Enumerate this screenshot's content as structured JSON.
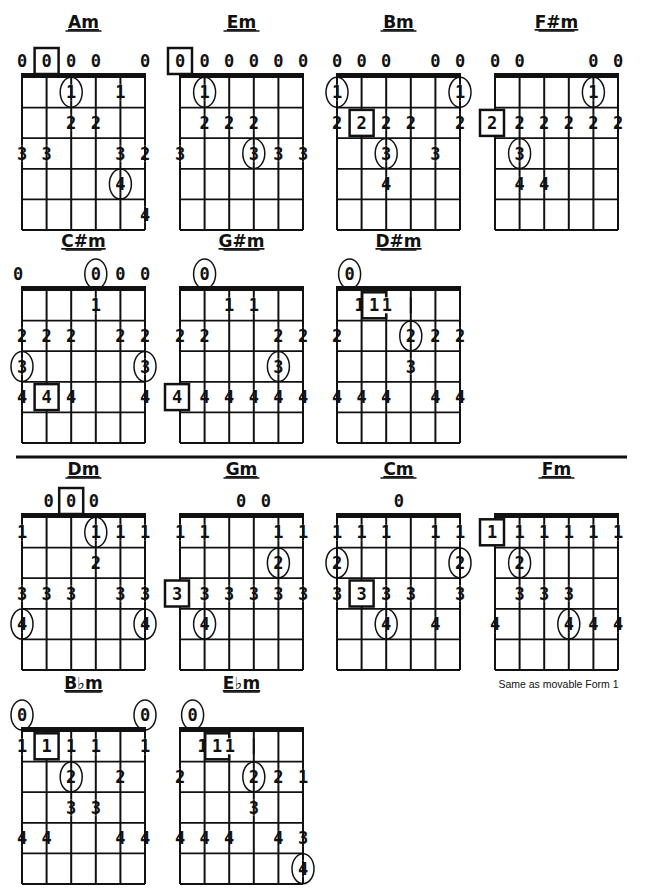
{
  "page": {
    "divider": {
      "y": 457,
      "x1": 16,
      "x2": 627
    },
    "layout": {
      "string_spacing": 24.6,
      "fret_spacing": 30.6,
      "frets": 5
    }
  },
  "chords": [
    {
      "name": "Am",
      "x": 22,
      "title_y": 28,
      "nut_y": 77,
      "marks": [
        {
          "s": 0,
          "f": 0,
          "t": "0"
        },
        {
          "s": 1,
          "f": 0,
          "t": "0",
          "style": "box"
        },
        {
          "s": 2,
          "f": 0,
          "t": "0"
        },
        {
          "s": 3,
          "f": 0,
          "t": "0"
        },
        {
          "s": 5,
          "f": 0,
          "t": "0"
        },
        {
          "s": 2,
          "f": 1,
          "t": "1",
          "style": "circle"
        },
        {
          "s": 4,
          "f": 1,
          "t": "1"
        },
        {
          "s": 2,
          "f": 2,
          "t": "2"
        },
        {
          "s": 3,
          "f": 2,
          "t": "2"
        },
        {
          "s": 0,
          "f": 3,
          "t": "3"
        },
        {
          "s": 1,
          "f": 3,
          "t": "3"
        },
        {
          "s": 4,
          "f": 3,
          "t": "3"
        },
        {
          "s": 5,
          "f": 3,
          "t": "2"
        },
        {
          "s": 4,
          "f": 4,
          "t": "4",
          "style": "circle"
        },
        {
          "s": 5,
          "f": 5,
          "t": "4"
        }
      ]
    },
    {
      "name": "Em",
      "x": 180,
      "title_y": 28,
      "nut_y": 77,
      "marks": [
        {
          "s": 0,
          "f": 0,
          "t": "0",
          "style": "box"
        },
        {
          "s": 1,
          "f": 0,
          "t": "0"
        },
        {
          "s": 2,
          "f": 0,
          "t": "0"
        },
        {
          "s": 3,
          "f": 0,
          "t": "0"
        },
        {
          "s": 4,
          "f": 0,
          "t": "0"
        },
        {
          "s": 5,
          "f": 0,
          "t": "0"
        },
        {
          "s": 1,
          "f": 1,
          "t": "1",
          "style": "circle"
        },
        {
          "s": 1,
          "f": 2,
          "t": "2"
        },
        {
          "s": 2,
          "f": 2,
          "t": "2"
        },
        {
          "s": 3,
          "f": 2,
          "t": "2"
        },
        {
          "s": 0,
          "f": 3,
          "t": "3"
        },
        {
          "s": 3,
          "f": 3,
          "t": "3",
          "style": "circle"
        },
        {
          "s": 4,
          "f": 3,
          "t": "3"
        },
        {
          "s": 5,
          "f": 3,
          "t": "3"
        }
      ]
    },
    {
      "name": "Bm",
      "x": 337,
      "title_y": 28,
      "nut_y": 77,
      "marks": [
        {
          "s": 0,
          "f": 0,
          "t": "0"
        },
        {
          "s": 1,
          "f": 0,
          "t": "0"
        },
        {
          "s": 2,
          "f": 0,
          "t": "0"
        },
        {
          "s": 4,
          "f": 0,
          "t": "0"
        },
        {
          "s": 5,
          "f": 0,
          "t": "0"
        },
        {
          "s": 0,
          "f": 1,
          "t": "1",
          "style": "circle"
        },
        {
          "s": 5,
          "f": 1,
          "t": "1",
          "style": "circle"
        },
        {
          "s": 0,
          "f": 2,
          "t": "2"
        },
        {
          "s": 1,
          "f": 2,
          "t": "2",
          "style": "box"
        },
        {
          "s": 2,
          "f": 2,
          "t": "2"
        },
        {
          "s": 3,
          "f": 2,
          "t": "2"
        },
        {
          "s": 5,
          "f": 2,
          "t": "2"
        },
        {
          "s": 2,
          "f": 3,
          "t": "3",
          "style": "circle"
        },
        {
          "s": 4,
          "f": 3,
          "t": "3"
        },
        {
          "s": 2,
          "f": 4,
          "t": "4"
        }
      ]
    },
    {
      "name": "F#m",
      "x": 495,
      "title_y": 28,
      "nut_y": 77,
      "marks": [
        {
          "s": 0,
          "f": 0,
          "t": "0"
        },
        {
          "s": 1,
          "f": 0,
          "t": "0"
        },
        {
          "s": 4,
          "f": 0,
          "t": "0"
        },
        {
          "s": 5,
          "f": 0,
          "t": "0"
        },
        {
          "s": 4,
          "f": 1,
          "t": "1",
          "style": "circle"
        },
        {
          "s": 0,
          "f": 2,
          "t": "2",
          "style": "box",
          "dx": -3
        },
        {
          "s": 1,
          "f": 2,
          "t": "2"
        },
        {
          "s": 2,
          "f": 2,
          "t": "2"
        },
        {
          "s": 3,
          "f": 2,
          "t": "2"
        },
        {
          "s": 4,
          "f": 2,
          "t": "2"
        },
        {
          "s": 5,
          "f": 2,
          "t": "2"
        },
        {
          "s": 1,
          "f": 3,
          "t": "3",
          "style": "circle"
        },
        {
          "s": 1,
          "f": 4,
          "t": "4"
        },
        {
          "s": 2,
          "f": 4,
          "t": "4"
        }
      ]
    },
    {
      "name": "C#m",
      "x": 22,
      "title_y": 247,
      "nut_y": 290,
      "marks": [
        {
          "s": 0,
          "f": 0,
          "t": "0",
          "dx": -4
        },
        {
          "s": 3,
          "f": 0,
          "t": "0",
          "style": "circle"
        },
        {
          "s": 4,
          "f": 0,
          "t": "0"
        },
        {
          "s": 5,
          "f": 0,
          "t": "0"
        },
        {
          "s": 3,
          "f": 1,
          "t": "1"
        },
        {
          "s": 0,
          "f": 2,
          "t": "2"
        },
        {
          "s": 1,
          "f": 2,
          "t": "2"
        },
        {
          "s": 2,
          "f": 2,
          "t": "2"
        },
        {
          "s": 4,
          "f": 2,
          "t": "2"
        },
        {
          "s": 5,
          "f": 2,
          "t": "2"
        },
        {
          "s": 0,
          "f": 3,
          "t": "3",
          "style": "circle"
        },
        {
          "s": 5,
          "f": 3,
          "t": "3",
          "style": "circle"
        },
        {
          "s": 0,
          "f": 4,
          "t": "4"
        },
        {
          "s": 1,
          "f": 4,
          "t": "4",
          "style": "box"
        },
        {
          "s": 2,
          "f": 4,
          "t": "4"
        },
        {
          "s": 5,
          "f": 4,
          "t": "4"
        }
      ]
    },
    {
      "name": "G#m",
      "x": 180,
      "title_y": 247,
      "nut_y": 290,
      "marks": [
        {
          "s": 1,
          "f": 0,
          "t": "0",
          "style": "circle"
        },
        {
          "s": 2,
          "f": 1,
          "t": "1"
        },
        {
          "s": 3,
          "f": 1,
          "t": "1"
        },
        {
          "s": 0,
          "f": 2,
          "t": "2"
        },
        {
          "s": 1,
          "f": 2,
          "t": "2"
        },
        {
          "s": 4,
          "f": 2,
          "t": "2"
        },
        {
          "s": 5,
          "f": 2,
          "t": "2"
        },
        {
          "s": 4,
          "f": 3,
          "t": "3",
          "style": "circle"
        },
        {
          "s": 0,
          "f": 4,
          "t": "4",
          "style": "box",
          "dx": -3
        },
        {
          "s": 1,
          "f": 4,
          "t": "4"
        },
        {
          "s": 2,
          "f": 4,
          "t": "4"
        },
        {
          "s": 3,
          "f": 4,
          "t": "4"
        },
        {
          "s": 4,
          "f": 4,
          "t": "4"
        },
        {
          "s": 5,
          "f": 4,
          "t": "4"
        }
      ]
    },
    {
      "name": "D#m",
      "x": 337,
      "title_y": 247,
      "nut_y": 290,
      "marks": [
        {
          "s": 1,
          "f": 0,
          "t": "0",
          "style": "circle",
          "dx": -12
        },
        {
          "s": 1,
          "f": 1,
          "t": "1",
          "dx": -2
        },
        {
          "s": 2,
          "f": 1,
          "t": "1",
          "style": "box",
          "dx": -12
        },
        {
          "s": 3,
          "f": 1,
          "t": "1",
          "dx": -24
        },
        {
          "s": 0,
          "f": 2,
          "t": "2"
        },
        {
          "s": 3,
          "f": 2,
          "t": "2",
          "style": "circle"
        },
        {
          "s": 4,
          "f": 2,
          "t": "2"
        },
        {
          "s": 5,
          "f": 2,
          "t": "2"
        },
        {
          "s": 3,
          "f": 3,
          "t": "3"
        },
        {
          "s": 0,
          "f": 4,
          "t": "4"
        },
        {
          "s": 1,
          "f": 4,
          "t": "4"
        },
        {
          "s": 2,
          "f": 4,
          "t": "4"
        },
        {
          "s": 4,
          "f": 4,
          "t": "4"
        },
        {
          "s": 5,
          "f": 4,
          "t": "4"
        }
      ]
    },
    {
      "name": "Dm",
      "x": 22,
      "title_y": 475,
      "nut_y": 517,
      "marks": [
        {
          "s": 1,
          "f": 0,
          "t": "0",
          "dx": 2
        },
        {
          "s": 2,
          "f": 0,
          "t": "0",
          "style": "box"
        },
        {
          "s": 3,
          "f": 0,
          "t": "0",
          "dx": -2
        },
        {
          "s": 0,
          "f": 1,
          "t": "1"
        },
        {
          "s": 3,
          "f": 1,
          "t": "1",
          "style": "circle"
        },
        {
          "s": 4,
          "f": 1,
          "t": "1"
        },
        {
          "s": 5,
          "f": 1,
          "t": "1"
        },
        {
          "s": 3,
          "f": 2,
          "t": "2"
        },
        {
          "s": 0,
          "f": 3,
          "t": "3"
        },
        {
          "s": 1,
          "f": 3,
          "t": "3"
        },
        {
          "s": 2,
          "f": 3,
          "t": "3"
        },
        {
          "s": 4,
          "f": 3,
          "t": "3"
        },
        {
          "s": 5,
          "f": 3,
          "t": "3"
        },
        {
          "s": 0,
          "f": 4,
          "t": "4",
          "style": "circle"
        },
        {
          "s": 5,
          "f": 4,
          "t": "4",
          "style": "circle"
        }
      ]
    },
    {
      "name": "Gm",
      "x": 180,
      "title_y": 475,
      "nut_y": 517,
      "marks": [
        {
          "s": 2,
          "f": 0,
          "t": "0",
          "dx": 12
        },
        {
          "s": 3,
          "f": 0,
          "t": "0",
          "dx": 12
        },
        {
          "s": 0,
          "f": 1,
          "t": "1"
        },
        {
          "s": 1,
          "f": 1,
          "t": "1"
        },
        {
          "s": 4,
          "f": 1,
          "t": "1"
        },
        {
          "s": 5,
          "f": 1,
          "t": "1"
        },
        {
          "s": 4,
          "f": 2,
          "t": "2",
          "style": "circle"
        },
        {
          "s": 0,
          "f": 3,
          "t": "3",
          "style": "box",
          "dx": -3
        },
        {
          "s": 1,
          "f": 3,
          "t": "3"
        },
        {
          "s": 2,
          "f": 3,
          "t": "3"
        },
        {
          "s": 3,
          "f": 3,
          "t": "3"
        },
        {
          "s": 4,
          "f": 3,
          "t": "3"
        },
        {
          "s": 5,
          "f": 3,
          "t": "3"
        },
        {
          "s": 1,
          "f": 4,
          "t": "4",
          "style": "circle"
        }
      ]
    },
    {
      "name": "Cm",
      "x": 337,
      "title_y": 475,
      "nut_y": 517,
      "marks": [
        {
          "s": 3,
          "f": 0,
          "t": "0",
          "dx": -12
        },
        {
          "s": 0,
          "f": 1,
          "t": "1"
        },
        {
          "s": 1,
          "f": 1,
          "t": "1"
        },
        {
          "s": 2,
          "f": 1,
          "t": "1"
        },
        {
          "s": 4,
          "f": 1,
          "t": "1"
        },
        {
          "s": 5,
          "f": 1,
          "t": "1"
        },
        {
          "s": 0,
          "f": 2,
          "t": "2",
          "style": "circle"
        },
        {
          "s": 5,
          "f": 2,
          "t": "2",
          "style": "circle"
        },
        {
          "s": 0,
          "f": 3,
          "t": "3"
        },
        {
          "s": 1,
          "f": 3,
          "t": "3",
          "style": "box"
        },
        {
          "s": 2,
          "f": 3,
          "t": "3"
        },
        {
          "s": 3,
          "f": 3,
          "t": "3"
        },
        {
          "s": 5,
          "f": 3,
          "t": "3"
        },
        {
          "s": 2,
          "f": 4,
          "t": "4",
          "style": "circle"
        },
        {
          "s": 4,
          "f": 4,
          "t": "4"
        }
      ]
    },
    {
      "name": "Fm",
      "x": 495,
      "title_y": 475,
      "nut_y": 517,
      "note": "Same as movable Form 1",
      "marks": [
        {
          "s": 0,
          "f": 1,
          "t": "1",
          "style": "box",
          "dx": -3
        },
        {
          "s": 1,
          "f": 1,
          "t": "1"
        },
        {
          "s": 2,
          "f": 1,
          "t": "1"
        },
        {
          "s": 3,
          "f": 1,
          "t": "1"
        },
        {
          "s": 4,
          "f": 1,
          "t": "1"
        },
        {
          "s": 5,
          "f": 1,
          "t": "1"
        },
        {
          "s": 1,
          "f": 2,
          "t": "2",
          "style": "circle"
        },
        {
          "s": 1,
          "f": 3,
          "t": "3"
        },
        {
          "s": 2,
          "f": 3,
          "t": "3"
        },
        {
          "s": 3,
          "f": 3,
          "t": "3"
        },
        {
          "s": 0,
          "f": 4,
          "t": "4"
        },
        {
          "s": 3,
          "f": 4,
          "t": "4",
          "style": "circle"
        },
        {
          "s": 4,
          "f": 4,
          "t": "4"
        },
        {
          "s": 5,
          "f": 4,
          "t": "4"
        }
      ]
    },
    {
      "name": "B♭m",
      "x": 22,
      "title_y": 689,
      "nut_y": 731,
      "marks": [
        {
          "s": 0,
          "f": 0,
          "t": "0",
          "style": "circle"
        },
        {
          "s": 5,
          "f": 0,
          "t": "0",
          "style": "circle"
        },
        {
          "s": 0,
          "f": 1,
          "t": "1"
        },
        {
          "s": 1,
          "f": 1,
          "t": "1",
          "style": "box"
        },
        {
          "s": 2,
          "f": 1,
          "t": "1"
        },
        {
          "s": 3,
          "f": 1,
          "t": "1"
        },
        {
          "s": 5,
          "f": 1,
          "t": "1"
        },
        {
          "s": 2,
          "f": 2,
          "t": "2",
          "style": "circle"
        },
        {
          "s": 4,
          "f": 2,
          "t": "2"
        },
        {
          "s": 2,
          "f": 3,
          "t": "3"
        },
        {
          "s": 3,
          "f": 3,
          "t": "3"
        },
        {
          "s": 0,
          "f": 4,
          "t": "4"
        },
        {
          "s": 1,
          "f": 4,
          "t": "4"
        },
        {
          "s": 4,
          "f": 4,
          "t": "4"
        },
        {
          "s": 5,
          "f": 4,
          "t": "4"
        }
      ]
    },
    {
      "name": "E♭m",
      "x": 180,
      "title_y": 689,
      "nut_y": 731,
      "marks": [
        {
          "s": 1,
          "f": 0,
          "t": "0",
          "style": "circle",
          "dx": -12
        },
        {
          "s": 1,
          "f": 1,
          "t": "1",
          "dx": -2
        },
        {
          "s": 2,
          "f": 1,
          "t": "1",
          "style": "box",
          "dx": -12
        },
        {
          "s": 3,
          "f": 1,
          "t": "1",
          "dx": -24
        },
        {
          "s": 0,
          "f": 2,
          "t": "2"
        },
        {
          "s": 3,
          "f": 2,
          "t": "2",
          "style": "circle"
        },
        {
          "s": 4,
          "f": 2,
          "t": "2"
        },
        {
          "s": 5,
          "f": 2,
          "t": "1"
        },
        {
          "s": 3,
          "f": 3,
          "t": "3"
        },
        {
          "s": 0,
          "f": 4,
          "t": "4"
        },
        {
          "s": 1,
          "f": 4,
          "t": "4"
        },
        {
          "s": 2,
          "f": 4,
          "t": "4"
        },
        {
          "s": 4,
          "f": 4,
          "t": "4"
        },
        {
          "s": 5,
          "f": 4,
          "t": "3"
        },
        {
          "s": 5,
          "f": 5,
          "t": "4",
          "style": "circle"
        }
      ]
    }
  ]
}
